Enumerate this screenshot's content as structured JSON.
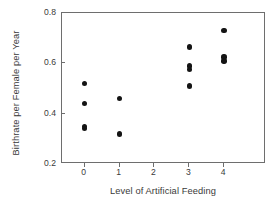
{
  "chart_data": {
    "type": "scatter",
    "title": "",
    "xlabel": "Level of Artificial Feeding",
    "ylabel": "Birthrate per Female per Year",
    "xlim": [
      -0.65,
      5.2
    ],
    "ylim": [
      0.2,
      0.8
    ],
    "xticks": [
      0,
      1,
      2,
      3,
      4
    ],
    "xtick_labels": [
      "0",
      "1",
      "2",
      "3",
      "4"
    ],
    "yticks": [
      0.2,
      0.4,
      0.6,
      0.8
    ],
    "ytick_labels": [
      "0.2",
      "0.4",
      "0.6",
      "0.8"
    ],
    "grid": false,
    "legend": null,
    "marker": "filled-circle",
    "marker_color": "#141414",
    "frame_color": "#6e6e6e",
    "text_color": "#3a3a3a",
    "background": "#ffffff",
    "points": [
      {
        "x": 0,
        "y": 0.52
      },
      {
        "x": 0,
        "y": 0.44
      },
      {
        "x": 0,
        "y": 0.35
      },
      {
        "x": 0,
        "y": 0.34
      },
      {
        "x": 1,
        "y": 0.46
      },
      {
        "x": 1,
        "y": 0.32
      },
      {
        "x": 3,
        "y": 0.665
      },
      {
        "x": 3,
        "y": 0.59
      },
      {
        "x": 3,
        "y": 0.575
      },
      {
        "x": 3,
        "y": 0.51
      },
      {
        "x": 4,
        "y": 0.73
      },
      {
        "x": 4,
        "y": 0.625
      },
      {
        "x": 4,
        "y": 0.61
      }
    ]
  }
}
